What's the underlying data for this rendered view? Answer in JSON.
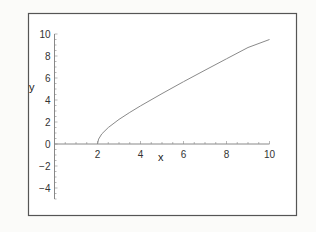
{
  "chart_data": {
    "type": "line",
    "title": "",
    "xlabel": "x",
    "ylabel": "y",
    "xlim": [
      0,
      10
    ],
    "ylim": [
      -5,
      10
    ],
    "grid": false,
    "legend": null,
    "x_ticks": [
      2,
      4,
      6,
      8,
      10
    ],
    "x_tick_labels": [
      "2",
      "4",
      "6",
      "8",
      "10"
    ],
    "y_ticks": [
      -4,
      -2,
      0,
      2,
      4,
      6,
      8,
      10
    ],
    "y_tick_labels": [
      "−4",
      "−2",
      "0",
      "2",
      "4",
      "6",
      "8",
      "10"
    ],
    "series": [
      {
        "name": "curve",
        "color": "#8a8a8a",
        "x": [
          2,
          2.05,
          2.2,
          2.5,
          3,
          3.5,
          4,
          5,
          6,
          7,
          8,
          9,
          10
        ],
        "y": [
          0,
          0.45,
          0.92,
          1.5,
          2.24,
          2.87,
          3.46,
          4.58,
          5.66,
          6.71,
          7.75,
          8.77,
          9.5
        ]
      }
    ]
  },
  "colors": {
    "frame": "#555555",
    "axis": "#888888",
    "curve": "#8a8a8a",
    "background": "#fbfbf9"
  }
}
